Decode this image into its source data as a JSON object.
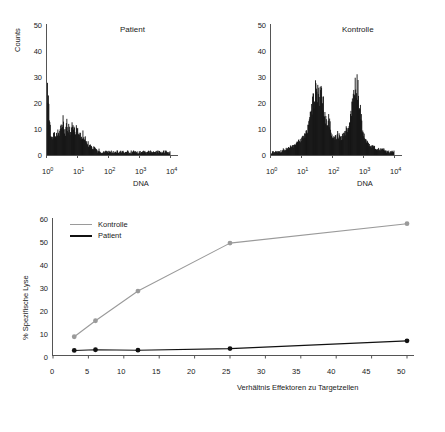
{
  "figure": {
    "panels": {
      "patient_hist": {
        "title": "Patient",
        "ylabel": "Counts",
        "xlabel": "DNA",
        "yticks": [
          "50",
          "40",
          "30",
          "20",
          "10",
          "0"
        ],
        "xticks": [
          "10",
          "10",
          "10",
          "10",
          "10"
        ],
        "xtick_exponents": [
          "0",
          "1",
          "2",
          "3",
          "4"
        ]
      },
      "kontrolle_hist": {
        "title": "Kontrolle",
        "xlabel": "DNA",
        "yticks": [
          "50",
          "40",
          "30",
          "20",
          "10",
          "0"
        ],
        "xticks": [
          "10",
          "10",
          "10",
          "10",
          "10"
        ],
        "xtick_exponents": [
          "0",
          "1",
          "2",
          "3",
          "4"
        ]
      },
      "lysis_chart": {
        "ylabel": "% Spezifische Lyse",
        "xlabel": "Verhältnis Effektoren zu Targetzellen",
        "yticks": [
          "60",
          "50",
          "40",
          "30",
          "20",
          "10",
          "0"
        ],
        "xticks": [
          "0",
          "5",
          "10",
          "15",
          "20",
          "25",
          "30",
          "35",
          "40",
          "45",
          "50"
        ],
        "legend": [
          {
            "label": "Kontrolle",
            "color": "#9a9a9a"
          },
          {
            "label": "Patient",
            "color": "#111111"
          }
        ]
      }
    }
  },
  "chart_data": [
    {
      "type": "bar",
      "name": "patient_dna_histogram",
      "title": "Patient",
      "xlabel": "DNA",
      "ylabel": "Counts",
      "xscale": "log",
      "xlim": [
        1,
        100000
      ],
      "ylim": [
        0,
        50
      ],
      "xticklabels": [
        "10^0",
        "10^1",
        "10^2",
        "10^3",
        "10^4"
      ],
      "yticklabels": [
        "0",
        "10",
        "20",
        "30",
        "40",
        "50"
      ],
      "grid": false,
      "bin_x_log10": [
        0.0,
        0.04,
        0.08,
        0.12,
        0.16,
        0.2,
        0.24,
        0.28,
        0.32,
        0.36,
        0.4,
        0.44,
        0.48,
        0.52,
        0.56,
        0.6,
        0.64,
        0.68,
        0.72,
        0.76,
        0.8,
        0.84,
        0.88,
        0.92,
        0.96,
        1.0,
        1.04,
        1.08,
        1.12,
        1.16,
        1.2,
        1.24,
        1.28,
        1.32,
        1.36,
        1.4,
        1.44,
        1.48,
        1.52,
        1.56,
        1.6,
        1.64,
        1.68,
        1.72,
        1.76,
        1.8,
        1.84,
        1.88,
        1.92,
        1.96,
        2.0,
        2.1,
        2.2,
        2.3,
        2.4,
        2.5,
        2.6,
        2.7,
        2.8,
        2.9,
        3.0,
        3.1,
        3.2,
        3.3,
        3.4,
        3.5,
        3.6,
        3.7,
        3.8,
        3.9,
        4.0
      ],
      "values": [
        28,
        21,
        12,
        8,
        6,
        7,
        9,
        6,
        8,
        10,
        7,
        11,
        9,
        13,
        10,
        8,
        12,
        9,
        11,
        8,
        10,
        13,
        9,
        7,
        11,
        8,
        9,
        7,
        6,
        8,
        5,
        6,
        4,
        5,
        3,
        4,
        3,
        2,
        3,
        2,
        2,
        1,
        2,
        1,
        1,
        1,
        1,
        1,
        1,
        1,
        1,
        1,
        1,
        1,
        1,
        1,
        1,
        1,
        1,
        1,
        1,
        1,
        1,
        1,
        1,
        1,
        1,
        1,
        1,
        1,
        1
      ],
      "description": "Single dominant low-DNA peak with broad decaying shoulder and flat baseline noise across higher decades."
    },
    {
      "type": "bar",
      "name": "kontrolle_dna_histogram",
      "title": "Kontrolle",
      "xlabel": "DNA",
      "ylabel": "Counts",
      "xscale": "log",
      "xlim": [
        1,
        100000
      ],
      "ylim": [
        0,
        50
      ],
      "xticklabels": [
        "10^0",
        "10^1",
        "10^2",
        "10^3",
        "10^4"
      ],
      "yticklabels": [
        "0",
        "10",
        "20",
        "30",
        "40",
        "50"
      ],
      "grid": false,
      "peaks": [
        {
          "name": "G1",
          "center_log10": 1.55,
          "height": 25
        },
        {
          "name": "G2/M",
          "center_log10": 2.75,
          "height": 27
        }
      ],
      "bin_x_log10": [
        0.0,
        0.1,
        0.2,
        0.3,
        0.4,
        0.5,
        0.6,
        0.7,
        0.8,
        0.9,
        1.0,
        1.08,
        1.16,
        1.24,
        1.32,
        1.4,
        1.46,
        1.52,
        1.58,
        1.64,
        1.7,
        1.76,
        1.82,
        1.88,
        1.94,
        2.0,
        2.08,
        2.16,
        2.24,
        2.32,
        2.4,
        2.48,
        2.56,
        2.62,
        2.68,
        2.74,
        2.8,
        2.86,
        2.92,
        2.98,
        3.05,
        3.15,
        3.25,
        3.35,
        3.45,
        3.55,
        3.65,
        3.75,
        3.85,
        3.95,
        4.0
      ],
      "values": [
        1,
        1,
        1,
        1,
        2,
        2,
        3,
        3,
        4,
        5,
        6,
        7,
        9,
        12,
        17,
        22,
        25,
        23,
        21,
        24,
        18,
        14,
        11,
        13,
        9,
        7,
        6,
        8,
        6,
        7,
        8,
        10,
        14,
        19,
        24,
        27,
        25,
        20,
        14,
        9,
        6,
        4,
        3,
        3,
        2,
        2,
        2,
        1,
        1,
        1,
        2
      ],
      "description": "Bimodal cell-cycle DNA profile: G1 peak near 10^1.5 reaching ~25 counts and G2/M peak near 10^2.75 reaching ~27 counts."
    },
    {
      "type": "line",
      "name": "specific_lysis",
      "title": "",
      "xlabel": "Verhältnis Effektoren zu Targetzellen",
      "ylabel": "% Spezifische Lyse",
      "xlim": [
        0,
        50
      ],
      "ylim": [
        0,
        60
      ],
      "xticks": [
        0,
        5,
        10,
        15,
        20,
        25,
        30,
        35,
        40,
        45,
        50
      ],
      "yticks": [
        0,
        10,
        20,
        30,
        40,
        50,
        60
      ],
      "grid": false,
      "legend_position": "upper-left-inside",
      "markers": "circle",
      "x": [
        3,
        6,
        12,
        25,
        50
      ],
      "series": [
        {
          "name": "Kontrolle",
          "color": "#9a9a9a",
          "values": [
            8,
            15,
            28,
            49,
            57.5
          ]
        },
        {
          "name": "Patient",
          "color": "#111111",
          "values": [
            2,
            2.3,
            2.1,
            2.8,
            6.2
          ]
        }
      ]
    }
  ]
}
